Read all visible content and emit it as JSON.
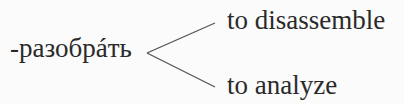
{
  "diagram": {
    "root": "-разобрáть",
    "branches": [
      {
        "label": "to disassemble"
      },
      {
        "label": "to analyze"
      }
    ],
    "line_color": "#555555"
  }
}
